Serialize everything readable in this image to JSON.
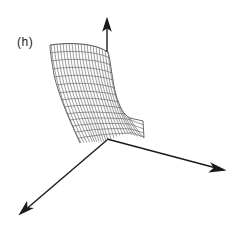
{
  "figure": {
    "panel_label": "(h)",
    "colors": {
      "background": "#ffffff",
      "axis": "#1a1a1a",
      "mesh": "#555555",
      "label": "#222222"
    },
    "axes": [
      {
        "name": "vertical-axis",
        "from": [
          107,
          140
        ],
        "to": [
          107,
          20
        ]
      },
      {
        "name": "right-axis",
        "from": [
          107,
          139
        ],
        "to": [
          224,
          170
        ]
      },
      {
        "name": "front-axis",
        "from": [
          107,
          140
        ],
        "to": [
          20,
          214
        ]
      }
    ]
  }
}
